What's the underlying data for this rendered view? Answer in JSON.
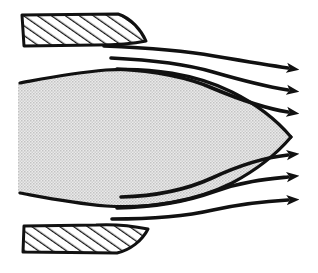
{
  "figure": {
    "background_color": "#ffffff",
    "ink_color": "#111111",
    "body_fill_color": "#d8d8d8",
    "wall_fill_color": "#ffffff",
    "hatch_color": "#111111",
    "width": 318,
    "height": 273
  },
  "chart_data": {
    "type": "diagram",
    "xlabel": "",
    "ylabel": "",
    "elements": [
      {
        "name": "upper-wall",
        "kind": "hatched-solid-boundary",
        "label": "upper channel wall",
        "hatch_angle_deg": 55,
        "hatch_spacing_px": 7,
        "bounds": {
          "x": 22,
          "y": 14,
          "width": 118,
          "height": 32
        }
      },
      {
        "name": "lower-wall",
        "kind": "hatched-solid-boundary",
        "label": "lower channel wall",
        "hatch_angle_deg": 55,
        "hatch_spacing_px": 7,
        "bounds": {
          "x": 22,
          "y": 224,
          "width": 123,
          "height": 29
        }
      },
      {
        "name": "streamlined-body",
        "kind": "stippled-lens-body",
        "label": "streamlined body",
        "tip": {
          "x": 291,
          "y": 137
        },
        "max_thickness_y": [
          82,
          196
        ],
        "left_edge_x": 18
      }
    ],
    "streamlines": [
      {
        "id": 1,
        "side": "upper",
        "start": [
          104,
          46
        ],
        "end": [
          288,
          68
        ]
      },
      {
        "id": 2,
        "side": "upper",
        "start": [
          111,
          58
        ],
        "end": [
          288,
          90
        ]
      },
      {
        "id": 3,
        "side": "upper",
        "start": [
          117,
          69
        ],
        "end": [
          288,
          112
        ]
      },
      {
        "id": 4,
        "side": "lower",
        "start": [
          121,
          197
        ],
        "end": [
          288,
          155
        ]
      },
      {
        "id": 5,
        "side": "lower",
        "start": [
          117,
          208
        ],
        "end": [
          288,
          177
        ]
      },
      {
        "id": 6,
        "side": "lower",
        "start": [
          112,
          219
        ],
        "end": [
          288,
          200
        ]
      }
    ],
    "arrow_tips_y": [
      68,
      90,
      112,
      155,
      177,
      200
    ],
    "arrow_tip_x": 300,
    "flow_direction": "left-to-right",
    "legend": [],
    "annotations": [],
    "grid": false
  }
}
